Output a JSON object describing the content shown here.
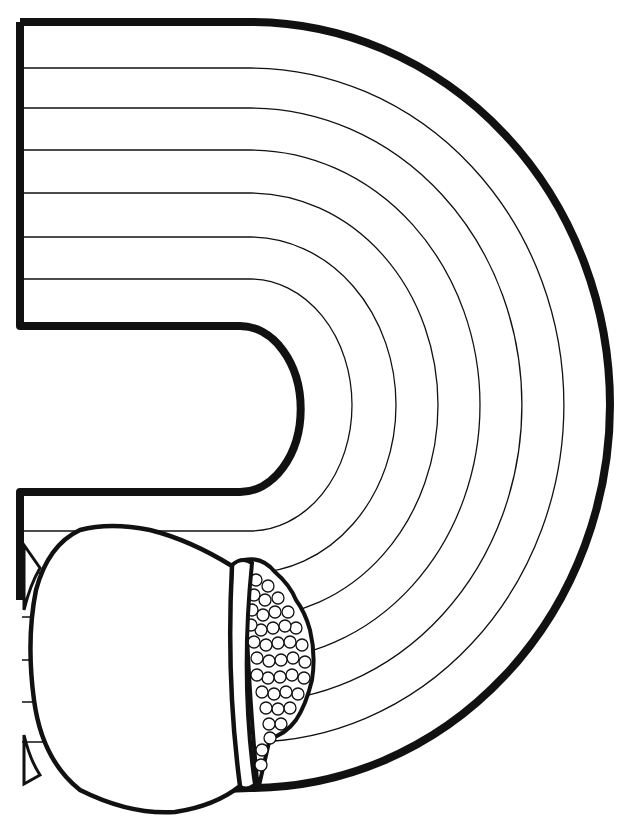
{
  "image": {
    "title": "Rainbow with pot of gold coloring page",
    "subject": "rainbow",
    "band_count": 7,
    "elements": [
      "rainbow-outline",
      "rainbow-bands",
      "pot",
      "pot-rim",
      "gold-coins"
    ],
    "colors": {
      "line": "#111111",
      "background": "#ffffff"
    }
  }
}
